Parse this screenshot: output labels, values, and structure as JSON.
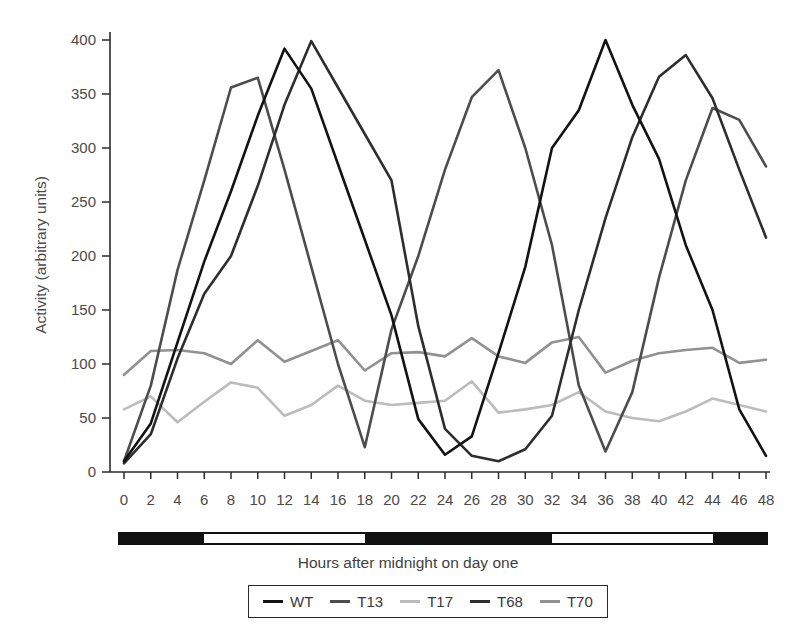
{
  "figure": {
    "ylabel": "Activity (arbitrary units)",
    "xlabel_caption": "Hours after midnight on day one"
  },
  "chart_data": {
    "type": "line",
    "title": "",
    "xlabel": "Hours after midnight on day one",
    "ylabel": "Activity (arbitrary units)",
    "xlim": [
      0,
      48
    ],
    "ylim": [
      0,
      400
    ],
    "grid": false,
    "legend_position": "bottom",
    "x_tick_step": 2,
    "x": [
      0,
      2,
      4,
      6,
      8,
      10,
      12,
      14,
      16,
      18,
      20,
      22,
      24,
      26,
      28,
      30,
      32,
      34,
      36,
      38,
      40,
      42,
      44,
      46,
      48
    ],
    "y_tick_values": [
      0,
      50,
      100,
      150,
      200,
      250,
      300,
      350,
      400
    ],
    "series": [
      {
        "name": "WT",
        "color": "#131313",
        "values": [
          10,
          45,
          120,
          195,
          260,
          330,
          392,
          355,
          285,
          215,
          145,
          49,
          16,
          33,
          110,
          190,
          300,
          335,
          400,
          340,
          290,
          210,
          150,
          58,
          15
        ]
      },
      {
        "name": "T13",
        "color": "#4d4d4d",
        "values": [
          10,
          80,
          187,
          270,
          356,
          365,
          280,
          190,
          100,
          23,
          132,
          200,
          280,
          347,
          372,
          300,
          210,
          80,
          19,
          74,
          180,
          270,
          337,
          326,
          283
        ]
      },
      {
        "name": "T17",
        "color": "#bcbcbc",
        "values": [
          58,
          70,
          46,
          65,
          83,
          78,
          52,
          62,
          80,
          66,
          62,
          64,
          66,
          84,
          55,
          58,
          62,
          74,
          56,
          50,
          47,
          56,
          68,
          62,
          56
        ]
      },
      {
        "name": "T68",
        "color": "#2e2e2e",
        "values": [
          8,
          35,
          105,
          165,
          200,
          265,
          340,
          399,
          356,
          313,
          270,
          135,
          40,
          15,
          10,
          21,
          52,
          150,
          235,
          310,
          366,
          386,
          346,
          280,
          217
        ]
      },
      {
        "name": "T70",
        "color": "#919191",
        "values": [
          90,
          112,
          113,
          110,
          100,
          122,
          102,
          112,
          122,
          94,
          110,
          111,
          107,
          124,
          107,
          101,
          120,
          125,
          92,
          103,
          110,
          113,
          115,
          101,
          104
        ]
      }
    ]
  },
  "photoperiod_bar": {
    "dark_color": "#111111",
    "light_color": "#fdfdfd",
    "segments": [
      {
        "from": 0,
        "to": 6,
        "shade": "dark"
      },
      {
        "from": 6,
        "to": 18,
        "shade": "light"
      },
      {
        "from": 18,
        "to": 32,
        "shade": "dark"
      },
      {
        "from": 32,
        "to": 44,
        "shade": "light"
      },
      {
        "from": 44,
        "to": 48,
        "shade": "dark"
      }
    ]
  },
  "legend": {
    "entries": [
      "WT",
      "T13",
      "T17",
      "T68",
      "T70"
    ]
  }
}
